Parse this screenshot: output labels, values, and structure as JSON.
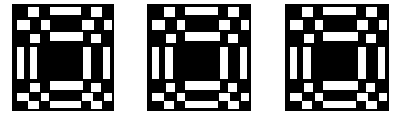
{
  "artwork": {
    "title": "Abstract Geometric Composition",
    "style": "de-stijl-grid",
    "canvas": {
      "width": 395,
      "height": 117
    },
    "colors": {
      "page_background": "#ffffff",
      "field": "#000000",
      "mark": "#ffffff"
    },
    "field": {
      "x": 12,
      "y": 4,
      "width": 377,
      "height": 107
    },
    "separators": [
      {
        "name": "separator-left",
        "x": 114,
        "y": 4,
        "width": 33,
        "height": 107
      },
      {
        "name": "separator-right",
        "x": 251,
        "y": 4,
        "width": 34,
        "height": 107
      }
    ],
    "modules": [
      {
        "name": "module-1",
        "x": 12,
        "width": 102
      },
      {
        "name": "module-2",
        "x": 147,
        "width": 104
      },
      {
        "name": "module-3",
        "x": 285,
        "width": 104
      }
    ],
    "module_marks": [
      {
        "x": 0.16,
        "y": 0.028,
        "w": 0.105,
        "h": 0.093
      },
      {
        "x": 0.37,
        "y": 0.028,
        "w": 0.31,
        "h": 0.075
      },
      {
        "x": 0.775,
        "y": 0.028,
        "w": 0.11,
        "h": 0.093
      },
      {
        "x": 0.045,
        "y": 0.15,
        "w": 0.13,
        "h": 0.093
      },
      {
        "x": 0.285,
        "y": 0.15,
        "w": 0.085,
        "h": 0.093
      },
      {
        "x": 0.69,
        "y": 0.15,
        "w": 0.11,
        "h": 0.093
      },
      {
        "x": 0.9,
        "y": 0.15,
        "w": 0.08,
        "h": 0.093
      },
      {
        "x": 0.18,
        "y": 0.28,
        "w": 0.095,
        "h": 0.085
      },
      {
        "x": 0.37,
        "y": 0.262,
        "w": 0.33,
        "h": 0.085
      },
      {
        "x": 0.775,
        "y": 0.28,
        "w": 0.1,
        "h": 0.085
      },
      {
        "x": 0.045,
        "y": 0.4,
        "w": 0.075,
        "h": 0.3
      },
      {
        "x": 0.175,
        "y": 0.4,
        "w": 0.075,
        "h": 0.3
      },
      {
        "x": 0.7,
        "y": 0.4,
        "w": 0.075,
        "h": 0.3
      },
      {
        "x": 0.895,
        "y": 0.4,
        "w": 0.07,
        "h": 0.3
      },
      {
        "x": 0.18,
        "y": 0.74,
        "w": 0.09,
        "h": 0.08
      },
      {
        "x": 0.37,
        "y": 0.722,
        "w": 0.33,
        "h": 0.08
      },
      {
        "x": 0.775,
        "y": 0.74,
        "w": 0.095,
        "h": 0.08
      },
      {
        "x": 0.045,
        "y": 0.83,
        "w": 0.12,
        "h": 0.08
      },
      {
        "x": 0.285,
        "y": 0.83,
        "w": 0.08,
        "h": 0.08
      },
      {
        "x": 0.69,
        "y": 0.83,
        "w": 0.105,
        "h": 0.08
      },
      {
        "x": 0.9,
        "y": 0.83,
        "w": 0.08,
        "h": 0.08
      },
      {
        "x": 0.16,
        "y": 0.905,
        "w": 0.1,
        "h": 0.08
      },
      {
        "x": 0.37,
        "y": 0.905,
        "w": 0.31,
        "h": 0.07
      },
      {
        "x": 0.775,
        "y": 0.905,
        "w": 0.105,
        "h": 0.08
      }
    ]
  }
}
